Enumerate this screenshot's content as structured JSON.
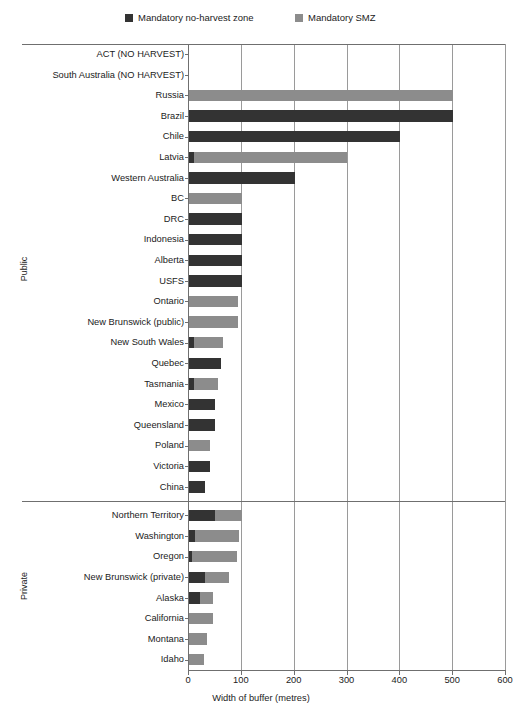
{
  "legend": {
    "items": [
      {
        "label": "Mandatory no-harvest zone",
        "color": "#333333",
        "name": "legend-no-harvest"
      },
      {
        "label": "Mandatory SMZ",
        "color": "#8c8c8c",
        "name": "legend-smz"
      }
    ]
  },
  "chart_data": {
    "type": "bar",
    "orientation": "horizontal",
    "stacked": true,
    "title": "",
    "xlabel": "Width of buffer (metres)",
    "ylabel": "",
    "xlim": [
      0,
      600
    ],
    "xticks": [
      0,
      100,
      200,
      300,
      400,
      500,
      600
    ],
    "grid": "vertical",
    "legend_position": "top",
    "series": [
      {
        "name": "Mandatory no-harvest zone",
        "color": "#333333"
      },
      {
        "name": "Mandatory SMZ",
        "color": "#8c8c8c"
      }
    ],
    "groups": [
      {
        "name": "Public",
        "categories": [
          "ACT (NO HARVEST)",
          "South Australia (NO HARVEST)",
          "Russia",
          "Brazil",
          "Chile",
          "Latvia",
          "Western Australia",
          "BC",
          "DRC",
          "Indonesia",
          "Alberta",
          "USFS",
          "Ontario",
          "New Brunswick (public)",
          "New South Wales",
          "Quebec",
          "Tasmania",
          "Mexico",
          "Queensland",
          "Poland",
          "Victoria",
          "China"
        ],
        "no_harvest": [
          0,
          0,
          0,
          500,
          400,
          10,
          200,
          0,
          100,
          100,
          100,
          100,
          0,
          0,
          10,
          60,
          10,
          50,
          50,
          0,
          40,
          30
        ],
        "smz": [
          0,
          0,
          500,
          0,
          0,
          290,
          0,
          100,
          0,
          0,
          0,
          0,
          92,
          92,
          55,
          0,
          45,
          0,
          0,
          40,
          0,
          0
        ]
      },
      {
        "name": "Private",
        "categories": [
          "Northern Territory",
          "Washington",
          "Oregon",
          "New Brunswick (private)",
          "Alaska",
          "California",
          "Montana",
          "Idaho"
        ],
        "no_harvest": [
          50,
          11,
          6,
          30,
          20,
          0,
          0,
          0
        ],
        "smz": [
          50,
          84,
          84,
          45,
          25,
          45,
          35,
          28
        ]
      }
    ]
  }
}
